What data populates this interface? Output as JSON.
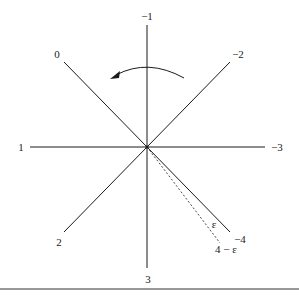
{
  "diagram": {
    "center": [
      147,
      147
    ],
    "rays": [
      {
        "label": "−1",
        "end": [
          147,
          25
        ],
        "label_pos": [
          147,
          20
        ]
      },
      {
        "label": "−2",
        "end": [
          230,
          62
        ],
        "label_pos": [
          238,
          58
        ]
      },
      {
        "label": "−3",
        "end": [
          265,
          147
        ],
        "label_pos": [
          276,
          151
        ]
      },
      {
        "label": "−4",
        "end": [
          230,
          232
        ],
        "label_pos": [
          240,
          243
        ]
      },
      {
        "label": "3",
        "end": [
          147,
          268
        ],
        "label_pos": [
          148,
          283
        ]
      },
      {
        "label": "2",
        "end": [
          64,
          232
        ],
        "label_pos": [
          59,
          246
        ]
      },
      {
        "label": "1",
        "end": [
          30,
          147
        ],
        "label_pos": [
          20,
          151
        ]
      },
      {
        "label": "0",
        "end": [
          64,
          62
        ],
        "label_pos": [
          57,
          58
        ]
      }
    ],
    "dashed_ray": {
      "end": [
        220,
        243
      ]
    },
    "annotations": {
      "epsilon": "ε",
      "four_minus_epsilon": "4 − ε"
    },
    "rotation_arrow": {
      "direction": "counterclockwise"
    },
    "colors": {
      "line": "#1a1a1a",
      "background": "#ffffff"
    }
  }
}
